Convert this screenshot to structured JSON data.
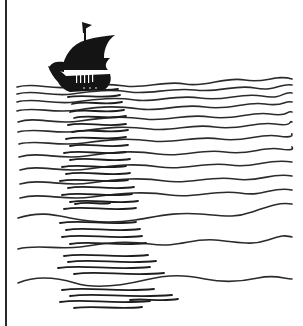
{
  "illustration": {
    "subject": "Sailing ship on wavy sea with reflection",
    "colors": {
      "background": "#ffffff",
      "ink": "#1e1e1e",
      "border": "#2a2a2a"
    },
    "left_border": {
      "x": 5,
      "width": 2
    },
    "ship": {
      "x_range": [
        48,
        116
      ],
      "y_range": [
        20,
        95
      ],
      "flag": "pennant-flag"
    },
    "wave_rows_left_start_y": [
      86,
      93,
      101,
      110,
      121,
      131,
      143,
      156,
      169,
      183,
      197,
      217,
      248,
      282
    ],
    "wave_right_end_x": 292,
    "reflection": {
      "x_range": [
        58,
        178
      ],
      "y_range": [
        88,
        312
      ]
    }
  }
}
